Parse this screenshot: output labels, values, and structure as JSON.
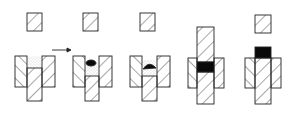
{
  "diagram": {
    "stages": [
      {
        "id": 1,
        "label": "Die filled with powder"
      },
      {
        "id": 2,
        "label": "Charge placed on powder"
      },
      {
        "id": 3,
        "label": "Charge pressed into powder"
      },
      {
        "id": 4,
        "label": "Compaction by upper and lower punch"
      },
      {
        "id": 5,
        "label": "Ejection of compact"
      }
    ],
    "colors": {
      "stroke": "#222222",
      "fill": "#ffffff",
      "compact": "#0a0a0a",
      "powder": "#888888"
    }
  }
}
